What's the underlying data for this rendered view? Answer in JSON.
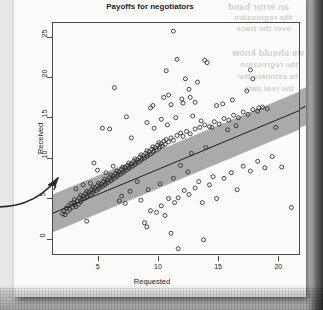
{
  "page": {
    "media": "scanned-book-page",
    "ghost_text": [
      {
        "text": "an error band",
        "x": 228,
        "y": 2,
        "size": 9
      },
      {
        "text": "the regression",
        "x": 234,
        "y": 13,
        "size": 8
      },
      {
        "text": "over the trace",
        "x": 236,
        "y": 24,
        "size": 8
      },
      {
        "text": "we should know",
        "x": 232,
        "y": 48,
        "size": 9
      },
      {
        "text": "the regression",
        "x": 240,
        "y": 60,
        "size": 8
      },
      {
        "text": "to estimate the",
        "x": 238,
        "y": 72,
        "size": 8
      },
      {
        "text": "the real data",
        "x": 244,
        "y": 84,
        "size": 8
      }
    ]
  },
  "annotation": {
    "type": "hand-drawn-arrow",
    "points_to_label": "regression line lower-left"
  },
  "chart_data": {
    "type": "scatter",
    "title": "Payoffs for negotiators",
    "xlabel": "Requested",
    "ylabel": "Received",
    "xlim": [
      1.2,
      21.8
    ],
    "ylim": [
      -2.0,
      26.8
    ],
    "xticks": [
      5,
      10,
      15,
      20
    ],
    "yticks": [
      0,
      5,
      10,
      15,
      20,
      25
    ],
    "grid": false,
    "legend": null,
    "point_style": {
      "marker": "open-circle",
      "radius": 2.0,
      "color": "#2a2a2a"
    },
    "fit_line": {
      "label": "regression line",
      "slope": 0.62,
      "intercept": 2.55,
      "color": "#1d1d1d",
      "extends_beyond_panel": true
    },
    "confidence_band": {
      "label": "error band",
      "color": "#8f8f8f",
      "opacity": 0.75,
      "half_width": 2.35
    },
    "points": [
      [
        2.0,
        3.2
      ],
      [
        2.1,
        3.6
      ],
      [
        2.2,
        3.1
      ],
      [
        2.3,
        3.9
      ],
      [
        2.4,
        3.5
      ],
      [
        2.5,
        4.2
      ],
      [
        2.6,
        3.8
      ],
      [
        2.7,
        4.5
      ],
      [
        2.8,
        4.0
      ],
      [
        2.9,
        4.6
      ],
      [
        3.0,
        4.3
      ],
      [
        3.0,
        5.0
      ],
      [
        3.1,
        4.1
      ],
      [
        3.2,
        4.8
      ],
      [
        3.3,
        4.4
      ],
      [
        3.4,
        5.2
      ],
      [
        3.5,
        4.7
      ],
      [
        3.5,
        5.5
      ],
      [
        3.6,
        5.0
      ],
      [
        3.7,
        5.4
      ],
      [
        3.8,
        5.1
      ],
      [
        3.9,
        5.7
      ],
      [
        4.0,
        5.3
      ],
      [
        4.0,
        6.0
      ],
      [
        4.1,
        5.5
      ],
      [
        4.2,
        5.9
      ],
      [
        4.3,
        5.6
      ],
      [
        4.4,
        6.2
      ],
      [
        4.5,
        5.8
      ],
      [
        4.5,
        6.5
      ],
      [
        4.6,
        6.0
      ],
      [
        4.7,
        6.4
      ],
      [
        4.8,
        6.1
      ],
      [
        4.9,
        6.7
      ],
      [
        5.0,
        6.3
      ],
      [
        5.0,
        7.0
      ],
      [
        5.1,
        6.5
      ],
      [
        5.2,
        6.9
      ],
      [
        5.3,
        6.6
      ],
      [
        5.4,
        7.2
      ],
      [
        5.5,
        6.8
      ],
      [
        5.5,
        7.5
      ],
      [
        5.6,
        7.0
      ],
      [
        5.7,
        7.4
      ],
      [
        5.8,
        7.1
      ],
      [
        5.9,
        7.7
      ],
      [
        6.0,
        7.3
      ],
      [
        6.0,
        8.0
      ],
      [
        6.1,
        7.5
      ],
      [
        6.2,
        7.9
      ],
      [
        6.3,
        7.6
      ],
      [
        6.4,
        8.2
      ],
      [
        6.5,
        7.8
      ],
      [
        6.5,
        8.5
      ],
      [
        6.6,
        8.0
      ],
      [
        6.7,
        8.4
      ],
      [
        6.8,
        8.1
      ],
      [
        6.9,
        8.7
      ],
      [
        7.0,
        8.3
      ],
      [
        7.0,
        9.0
      ],
      [
        7.1,
        8.5
      ],
      [
        7.2,
        8.9
      ],
      [
        7.3,
        8.6
      ],
      [
        7.4,
        9.2
      ],
      [
        7.5,
        8.8
      ],
      [
        7.5,
        9.5
      ],
      [
        7.6,
        9.0
      ],
      [
        7.7,
        9.4
      ],
      [
        7.8,
        9.1
      ],
      [
        7.9,
        9.7
      ],
      [
        8.0,
        9.3
      ],
      [
        8.0,
        10.0
      ],
      [
        8.1,
        9.5
      ],
      [
        8.2,
        9.9
      ],
      [
        8.3,
        9.6
      ],
      [
        8.4,
        10.2
      ],
      [
        8.5,
        9.8
      ],
      [
        8.5,
        10.5
      ],
      [
        8.6,
        10.0
      ],
      [
        8.7,
        10.4
      ],
      [
        8.8,
        10.1
      ],
      [
        8.9,
        10.7
      ],
      [
        9.0,
        10.3
      ],
      [
        9.0,
        11.0
      ],
      [
        9.1,
        10.5
      ],
      [
        9.2,
        10.9
      ],
      [
        9.3,
        10.6
      ],
      [
        9.4,
        11.2
      ],
      [
        9.5,
        10.8
      ],
      [
        9.5,
        11.5
      ],
      [
        9.6,
        11.0
      ],
      [
        9.7,
        11.4
      ],
      [
        9.8,
        11.1
      ],
      [
        9.9,
        11.7
      ],
      [
        10.0,
        11.3
      ],
      [
        10.0,
        12.0
      ],
      [
        10.1,
        11.5
      ],
      [
        10.2,
        11.9
      ],
      [
        10.3,
        11.6
      ],
      [
        10.4,
        12.2
      ],
      [
        10.5,
        11.8
      ],
      [
        10.6,
        12.4
      ],
      [
        10.8,
        12.1
      ],
      [
        11.0,
        12.6
      ],
      [
        11.2,
        12.3
      ],
      [
        11.5,
        12.9
      ],
      [
        11.8,
        13.2
      ],
      [
        12.0,
        12.8
      ],
      [
        12.3,
        13.4
      ],
      [
        12.6,
        13.1
      ],
      [
        13.0,
        13.7
      ],
      [
        13.4,
        13.9
      ],
      [
        13.8,
        14.2
      ],
      [
        14.2,
        14.0
      ],
      [
        14.6,
        14.6
      ],
      [
        15.0,
        14.3
      ],
      [
        15.4,
        15.0
      ],
      [
        15.8,
        14.8
      ],
      [
        16.2,
        15.4
      ],
      [
        16.6,
        15.1
      ],
      [
        17.0,
        15.8
      ],
      [
        17.4,
        15.5
      ],
      [
        17.8,
        16.1
      ],
      [
        18.2,
        15.9
      ],
      [
        18.6,
        16.4
      ],
      [
        19.0,
        16.2
      ],
      [
        11.2,
        25.8
      ],
      [
        10.6,
        20.9
      ],
      [
        11.5,
        22.3
      ],
      [
        13.8,
        22.2
      ],
      [
        14.0,
        21.9
      ],
      [
        17.6,
        21.0
      ],
      [
        17.8,
        19.9
      ],
      [
        12.2,
        19.9
      ],
      [
        13.2,
        19.5
      ],
      [
        12.5,
        18.6
      ],
      [
        17.3,
        18.4
      ],
      [
        6.3,
        18.8
      ],
      [
        9.3,
        16.3
      ],
      [
        9.5,
        16.6
      ],
      [
        7.3,
        15.2
      ],
      [
        11.9,
        17.4
      ],
      [
        12.0,
        16.9
      ],
      [
        12.6,
        17.6
      ],
      [
        13.0,
        17.0
      ],
      [
        14.8,
        16.6
      ],
      [
        15.3,
        16.8
      ],
      [
        16.1,
        17.3
      ],
      [
        10.4,
        17.6
      ],
      [
        10.8,
        17.9
      ],
      [
        11.0,
        16.7
      ],
      [
        5.3,
        13.8
      ],
      [
        5.9,
        13.7
      ],
      [
        7.7,
        12.6
      ],
      [
        9.0,
        14.5
      ],
      [
        9.6,
        13.8
      ],
      [
        10.2,
        14.9
      ],
      [
        10.7,
        14.2
      ],
      [
        11.4,
        15.1
      ],
      [
        12.8,
        15.3
      ],
      [
        13.5,
        14.7
      ],
      [
        14.4,
        13.9
      ],
      [
        15.7,
        13.6
      ],
      [
        16.4,
        14.1
      ],
      [
        18.3,
        16.3
      ],
      [
        19.7,
        13.9
      ],
      [
        4.6,
        9.5
      ],
      [
        4.0,
        2.3
      ],
      [
        6.7,
        4.8
      ],
      [
        7.2,
        4.5
      ],
      [
        8.5,
        4.9
      ],
      [
        8.8,
        2.1
      ],
      [
        9.0,
        1.6
      ],
      [
        9.3,
        3.6
      ],
      [
        9.8,
        3.4
      ],
      [
        10.2,
        4.2
      ],
      [
        10.5,
        3.0
      ],
      [
        10.8,
        5.1
      ],
      [
        11.0,
        0.8
      ],
      [
        11.3,
        4.6
      ],
      [
        11.6,
        5.2
      ],
      [
        11.6,
        -1.1
      ],
      [
        12.1,
        6.1
      ],
      [
        12.5,
        5.6
      ],
      [
        13.0,
        6.4
      ],
      [
        13.3,
        7.2
      ],
      [
        13.6,
        4.6
      ],
      [
        13.7,
        0.0
      ],
      [
        14.2,
        6.8
      ],
      [
        14.5,
        7.8
      ],
      [
        14.8,
        5.1
      ],
      [
        15.4,
        7.6
      ],
      [
        16.0,
        8.3
      ],
      [
        16.5,
        6.2
      ],
      [
        17.0,
        9.1
      ],
      [
        17.6,
        8.5
      ],
      [
        18.2,
        9.7
      ],
      [
        18.8,
        8.9
      ],
      [
        19.4,
        10.3
      ],
      [
        20.2,
        9.0
      ],
      [
        21.0,
        4.0
      ],
      [
        12.7,
        10.7
      ],
      [
        13.9,
        11.4
      ],
      [
        11.8,
        9.2
      ],
      [
        12.4,
        8.4
      ],
      [
        11.2,
        7.6
      ],
      [
        10.1,
        6.9
      ],
      [
        9.1,
        6.2
      ],
      [
        8.2,
        7.2
      ],
      [
        7.6,
        6.0
      ],
      [
        6.9,
        5.4
      ],
      [
        6.2,
        9.1
      ],
      [
        5.6,
        8.3
      ],
      [
        4.9,
        8.6
      ],
      [
        4.3,
        7.0
      ],
      [
        3.7,
        6.8
      ],
      [
        3.1,
        6.3
      ]
    ]
  }
}
